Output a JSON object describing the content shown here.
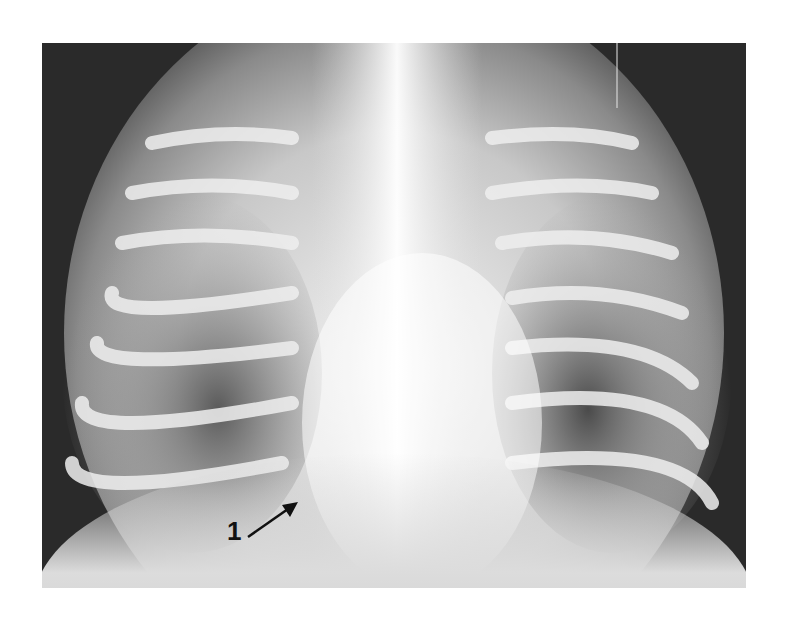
{
  "image": {
    "subject": "chest radiograph (frontal view)",
    "background_color": "#ffffff",
    "film_dark_color": "#2a2a2a",
    "bone_color": "#f2f2f2"
  },
  "annotations": [
    {
      "label": "1",
      "type": "arrow",
      "direction": "up-right",
      "color": "#111111"
    }
  ]
}
